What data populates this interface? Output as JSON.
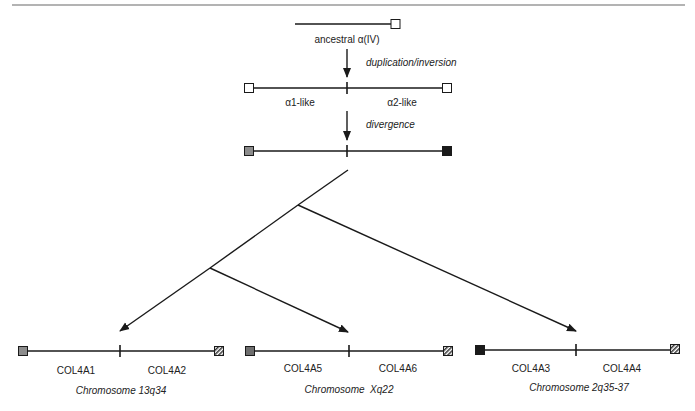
{
  "header_rule": {
    "color": "#9a9a9a"
  },
  "ancestral": {
    "label": "ancestral α(IV)"
  },
  "steps": [
    {
      "label": "duplication/inversion"
    },
    {
      "label": "divergence"
    }
  ],
  "duplicated": {
    "left_label": "α1-like",
    "right_label": "α2-like"
  },
  "chromosomes": [
    {
      "left_gene": "COL4A1",
      "right_gene": "COL4A2",
      "name": "Chromosome 13q34",
      "left_box": "gray",
      "right_box": "hatched"
    },
    {
      "left_gene": "COL4A5",
      "right_gene": "COL4A6",
      "name": "Chromosome  Xq22",
      "left_box": "gray",
      "right_box": "hatched"
    },
    {
      "left_gene": "COL4A3",
      "right_gene": "COL4A4",
      "name": "Chromosome 2q35-37",
      "left_box": "black",
      "right_box": "hatched"
    }
  ],
  "colors": {
    "line": "#1a1a1a",
    "gray_box": "#8c8c8c",
    "black_box": "#1a1a1a",
    "white_box": "#ffffff"
  }
}
